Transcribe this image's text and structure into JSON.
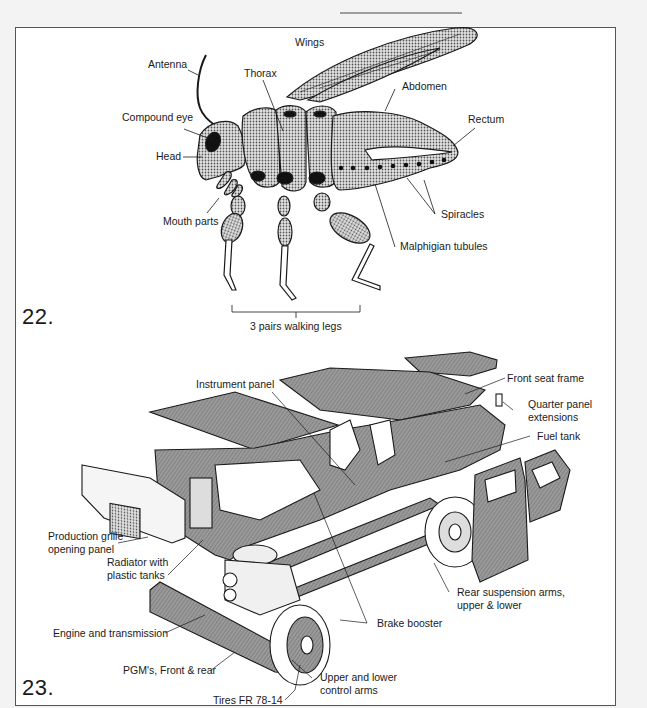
{
  "figures": [
    {
      "number": "22.",
      "subject": "Insect anatomy",
      "labels": {
        "wings": "Wings",
        "antenna": "Antenna",
        "thorax": "Thorax",
        "abdomen": "Abdomen",
        "compound_eye": "Compound eye",
        "rectum": "Rectum",
        "head": "Head",
        "mouth_parts": "Mouth parts",
        "spiracles": "Spiracles",
        "malphigian_tubules": "Malphigian tubules",
        "walking_legs": "3 pairs walking legs"
      }
    },
    {
      "number": "23.",
      "subject": "Exploded automobile",
      "labels": {
        "instrument_panel": "Instrument panel",
        "front_seat_frame": "Front seat frame",
        "quarter_panel_1": "Quarter panel",
        "quarter_panel_2": "extensions",
        "fuel_tank": "Fuel tank",
        "grille_1": "Production grille",
        "grille_2": "opening panel",
        "radiator_1": "Radiator with",
        "radiator_2": "plastic tanks",
        "rear_susp_1": "Rear suspension arms,",
        "rear_susp_2": "upper & lower",
        "engine": "Engine and transmission",
        "brake_booster": "Brake booster",
        "pgm": "PGM's, Front & rear",
        "control_arms_1": "Upper and lower",
        "control_arms_2": "control arms",
        "tires": "Tires FR 78-14"
      }
    }
  ],
  "colors": {
    "ink": "#1a1a1a",
    "shade": "#8a8a8a",
    "page": "#ffffff",
    "frame": "#555555"
  }
}
